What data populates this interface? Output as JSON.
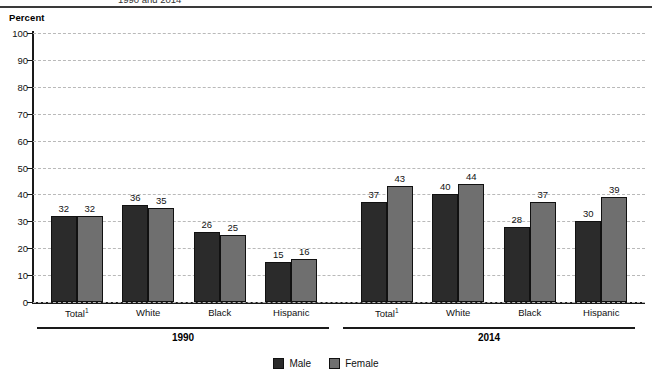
{
  "header": {
    "clipped_title": "1990 and 2014",
    "axis_title": "Percent"
  },
  "legend": {
    "position": "bottom-center",
    "items": [
      {
        "label": "Male",
        "color": "#2b2b2b",
        "swatch": "male-swatch"
      },
      {
        "label": "Female",
        "color": "#6f6f6f",
        "swatch": "female-swatch"
      }
    ]
  },
  "groups": [
    {
      "label": "1990"
    },
    {
      "label": "2014"
    }
  ],
  "chart_data": {
    "type": "bar",
    "title": "1990 and 2014",
    "xlabel": "",
    "ylabel": "Percent",
    "ylim": [
      0,
      100
    ],
    "yticks": [
      0,
      10,
      20,
      30,
      40,
      50,
      60,
      70,
      80,
      90,
      100
    ],
    "ytick_labels": [
      "0",
      "10",
      "20",
      "30",
      "40",
      "50",
      "60",
      "70",
      "80",
      "90",
      "100"
    ],
    "grid": true,
    "grid_style": "dashed-horizontal",
    "panels": [
      {
        "name": "1990",
        "categories": [
          "Total¹",
          "White",
          "Black",
          "Hispanic"
        ],
        "series": [
          {
            "name": "Male",
            "color": "#2b2b2b",
            "values": [
              32,
              36,
              26,
              15
            ]
          },
          {
            "name": "Female",
            "color": "#6f6f6f",
            "values": [
              32,
              35,
              25,
              16
            ]
          }
        ]
      },
      {
        "name": "2014",
        "categories": [
          "Total¹",
          "White",
          "Black",
          "Hispanic"
        ],
        "series": [
          {
            "name": "Male",
            "color": "#2b2b2b",
            "values": [
              37,
              40,
              28,
              30
            ]
          },
          {
            "name": "Female",
            "color": "#6f6f6f",
            "values": [
              43,
              44,
              37,
              39
            ]
          }
        ]
      }
    ]
  }
}
